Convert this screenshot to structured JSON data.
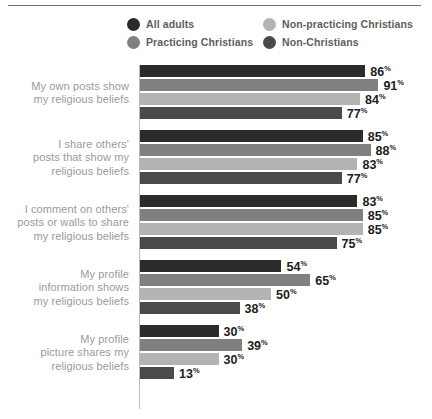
{
  "legend": {
    "items": [
      {
        "label": "All adults",
        "color": "#2b2b2b",
        "icon": "legend-dot-icon"
      },
      {
        "label": "Non-practicing Christians",
        "color": "#b3b3b3",
        "icon": "legend-dot-icon"
      },
      {
        "label": "Practicing Christians",
        "color": "#808080",
        "icon": "legend-dot-icon"
      },
      {
        "label": "Non-Christians",
        "color": "#4a4a4a",
        "icon": "legend-dot-icon"
      }
    ]
  },
  "chart_data": {
    "type": "bar",
    "orientation": "horizontal",
    "title": "",
    "subtitle": "",
    "xlabel": "",
    "ylabel": "",
    "xlim": [
      0,
      100
    ],
    "grid": false,
    "legend_position": "top",
    "value_suffix": "%",
    "categories": [
      "My own posts show my religious beliefs",
      "I share others' posts that show my religious beliefs",
      "I comment on others' posts or walls to share my religious beliefs",
      "My profile information shows my religious beliefs",
      "My profile picture shares my religious beliefs"
    ],
    "category_lines": [
      [
        "My own posts show",
        "my religious beliefs"
      ],
      [
        "I share others'",
        "posts that show my",
        "religious beliefs"
      ],
      [
        "I comment on others'",
        "posts or walls to share",
        "my religious beliefs"
      ],
      [
        "My profile",
        "information shows",
        "my religious beliefs"
      ],
      [
        "My profile",
        "picture shares my",
        "religious beliefs"
      ]
    ],
    "series": [
      {
        "name": "All adults",
        "color": "#2b2b2b",
        "values": [
          86,
          85,
          83,
          54,
          30
        ]
      },
      {
        "name": "Practicing Christians",
        "color": "#808080",
        "values": [
          91,
          88,
          85,
          65,
          39
        ]
      },
      {
        "name": "Non-practicing Christians",
        "color": "#b3b3b3",
        "values": [
          84,
          83,
          85,
          50,
          30
        ]
      },
      {
        "name": "Non-Christians",
        "color": "#4a4a4a",
        "values": [
          77,
          77,
          75,
          38,
          13
        ]
      }
    ],
    "value_labels": [
      [
        "86",
        "91",
        "84",
        "77"
      ],
      [
        "85",
        "88",
        "83",
        "77"
      ],
      [
        "83",
        "85",
        "85",
        "75"
      ],
      [
        "54",
        "65",
        "50",
        "38"
      ],
      [
        "30",
        "39",
        "30",
        "13"
      ]
    ]
  }
}
